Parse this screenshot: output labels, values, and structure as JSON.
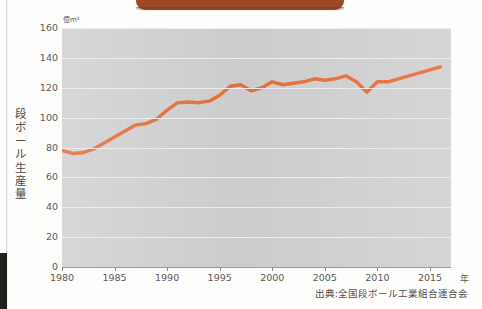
{
  "chart_data": {
    "type": "line",
    "title": "",
    "ylabel": "段ボール生産量",
    "yunit": "億m²",
    "xlabel": "年",
    "ylim": [
      0,
      160
    ],
    "xlim": [
      1980,
      2017
    ],
    "yticks": [
      0,
      20,
      40,
      60,
      80,
      100,
      120,
      140,
      160
    ],
    "xticks": [
      1980,
      1985,
      1990,
      1995,
      2000,
      2005,
      2010,
      2015
    ],
    "grid": true,
    "legend": "none",
    "line_color": "#e8703a",
    "plot_background": "#d2d2d2",
    "source": "出典:全国段ボール工業組合連合会",
    "series": [
      {
        "name": "段ボール生産量",
        "x": [
          1980,
          1981,
          1982,
          1983,
          1984,
          1985,
          1986,
          1987,
          1988,
          1989,
          1990,
          1991,
          1992,
          1993,
          1994,
          1995,
          1996,
          1997,
          1998,
          1999,
          2000,
          2001,
          2002,
          2003,
          2004,
          2005,
          2006,
          2007,
          2008,
          2009,
          2010,
          2011,
          2012,
          2013,
          2014,
          2015,
          2016
        ],
        "values": [
          78,
          76,
          76.5,
          79,
          83,
          87,
          91,
          95,
          96,
          99,
          105,
          110,
          110.5,
          110,
          111,
          115,
          121,
          122,
          118,
          120,
          124,
          122,
          123,
          124,
          126,
          125,
          126,
          128,
          124,
          117,
          124,
          124,
          126,
          128,
          130,
          132,
          134
        ]
      }
    ]
  },
  "annotations": {
    "y_axis_unit": "億m²",
    "x_axis_unit": "年"
  }
}
